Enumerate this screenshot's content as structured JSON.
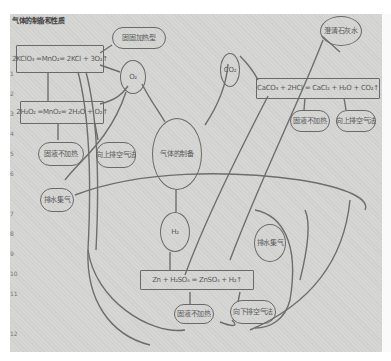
{
  "title": "气体的制备和性质",
  "diagram": {
    "center": {
      "label": "气体的制备"
    },
    "gases": {
      "o2": {
        "label": "O₂"
      },
      "co2": {
        "label": "CO₂"
      },
      "h2": {
        "label": "H₂"
      }
    },
    "reactions": [
      {
        "id": "kclo3",
        "equation": "2KClO₃ =MnO₂= 2KCl + 3O₂↑"
      },
      {
        "id": "h2o2",
        "equation": "2H₂O₂ =MnO₂= 2H₂O + O₂↑"
      },
      {
        "id": "caco3",
        "equation": "CaCO₃ + 2HCl = CaCl₂ + H₂O + CO₂↑"
      },
      {
        "id": "zn",
        "equation": "Zn + H₂SO₄ = ZnSO₄ + H₂↑"
      }
    ],
    "bubbles": {
      "solid_heat": "固固加热型",
      "solid_liquid": "固液不加热",
      "upward_air": "向上排空气法",
      "water": "排水集气",
      "lime_water": "澄清石灰水",
      "co2_solid_liquid": "固液不加热",
      "co2_upward": "向上排空气法",
      "h2_collect": "排水集气",
      "h2_solid_liquid": "固液不加热",
      "h2_downward": "向下排空气法"
    },
    "margin_marks": [
      "1",
      "2",
      "3",
      "4",
      "5",
      "6",
      "7",
      "8",
      "9",
      "10",
      "11",
      "12"
    ]
  }
}
